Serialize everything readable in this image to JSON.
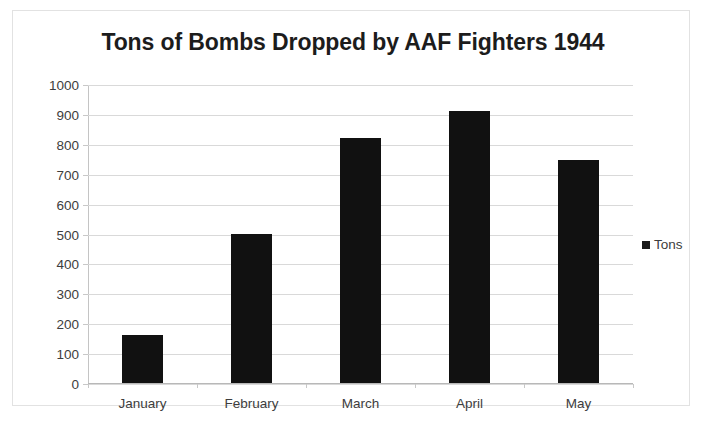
{
  "chart_data": {
    "type": "bar",
    "title": "Tons of Bombs Dropped by AAF Fighters 1944",
    "xlabel": "",
    "ylabel": "",
    "categories": [
      "January",
      "February",
      "March",
      "April",
      "May"
    ],
    "values": [
      160,
      500,
      820,
      910,
      745
    ],
    "series": [
      {
        "name": "Tons",
        "values": [
          160,
          500,
          820,
          910,
          745
        ]
      }
    ],
    "ylim": [
      0,
      1000
    ],
    "ytick_labels": [
      "1000",
      "900",
      "800",
      "700",
      "600",
      "500",
      "400",
      "300",
      "200",
      "100",
      "0"
    ],
    "ytick_values": [
      1000,
      900,
      800,
      700,
      600,
      500,
      400,
      300,
      200,
      100,
      0
    ],
    "grid": true,
    "legend": {
      "position": "right",
      "entries": [
        "Tons"
      ]
    },
    "colors": {
      "bar": "#111111",
      "gridline": "#d9d9d9",
      "axis": "#c4c4c4",
      "title": "#1c1c1c",
      "tick_label": "#3d3d3d",
      "border": "#e2e2e2",
      "background": "#ffffff"
    }
  }
}
